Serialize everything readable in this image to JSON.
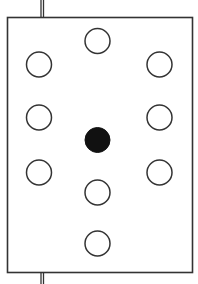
{
  "diagram": {
    "width": 198,
    "height": 284,
    "background": "#ffffff",
    "stroke_color": "#333333",
    "fill_color": "#111111",
    "frame": {
      "x": 7.5,
      "y": 17.5,
      "width": 185,
      "height": 255,
      "stroke_width": 1.6
    },
    "connectors": [
      {
        "name": "top-stub",
        "x1": 41,
        "x2": 43.5,
        "y1": 0,
        "y2": 17.5
      },
      {
        "name": "bottom-stub",
        "x1": 41,
        "x2": 43.5,
        "y1": 272.5,
        "y2": 284
      }
    ],
    "circle_radius": 12.5,
    "circles": [
      {
        "name": "top-center",
        "cx": 97.5,
        "cy": 41,
        "filled": false
      },
      {
        "name": "upper-left",
        "cx": 39,
        "cy": 64.5,
        "filled": false
      },
      {
        "name": "upper-right",
        "cx": 159.5,
        "cy": 64.5,
        "filled": false
      },
      {
        "name": "middle-left",
        "cx": 39,
        "cy": 117.5,
        "filled": false
      },
      {
        "name": "middle-right",
        "cx": 159.5,
        "cy": 117.5,
        "filled": false
      },
      {
        "name": "center",
        "cx": 97.5,
        "cy": 140,
        "filled": true
      },
      {
        "name": "lower-left",
        "cx": 39,
        "cy": 172.5,
        "filled": false
      },
      {
        "name": "lower-right",
        "cx": 159.5,
        "cy": 172.5,
        "filled": false
      },
      {
        "name": "lower-center",
        "cx": 97.5,
        "cy": 192.5,
        "filled": false
      },
      {
        "name": "bottom-center",
        "cx": 97.5,
        "cy": 243.5,
        "filled": false
      }
    ],
    "counts": {
      "total_circles": 10,
      "filled_circles": 1,
      "hollow_circles": 9
    }
  }
}
